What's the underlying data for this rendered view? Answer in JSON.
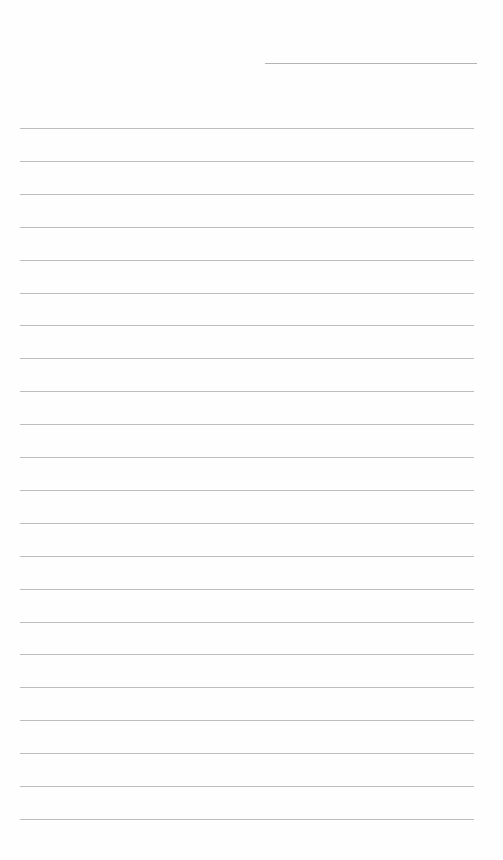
{
  "page": {
    "type": "ruled-notepaper",
    "background_color": "#ffffff",
    "line_color": "#bdbdbd",
    "date_line": {
      "label": "",
      "value": ""
    },
    "ruled_lines": {
      "count": 22,
      "first_y": 128,
      "spacing": 32.9,
      "contents": [
        "",
        "",
        "",
        "",
        "",
        "",
        "",
        "",
        "",
        "",
        "",
        "",
        "",
        "",
        "",
        "",
        "",
        "",
        "",
        "",
        "",
        ""
      ]
    }
  }
}
